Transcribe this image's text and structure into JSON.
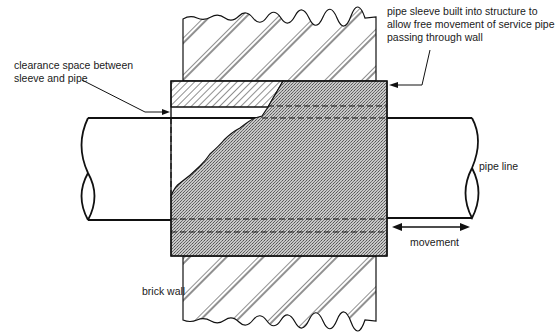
{
  "diagram": {
    "labels": {
      "clearance": [
        "clearance space between",
        "sleeve and pipe"
      ],
      "sleeve": [
        "pipe sleeve built into structure to",
        "allow free movement of service pipe",
        "passing through wall"
      ],
      "pipe_line": "pipe line",
      "movement": "movement",
      "brick_wall": "brick wall"
    },
    "colors": {
      "line": "#111111",
      "sleeve_fill": "#b9b9b9",
      "background": "#ffffff"
    }
  }
}
